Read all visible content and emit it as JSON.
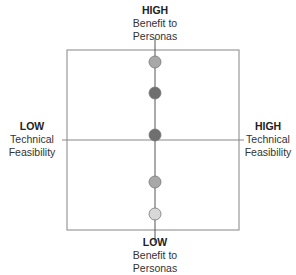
{
  "labels": {
    "top": {
      "level": "HIGH",
      "line1": "Benefit to",
      "line2": "Personas"
    },
    "bottom": {
      "level": "LOW",
      "line1": "Benefit to",
      "line2": "Personas"
    },
    "left": {
      "level": "LOW",
      "line1": "Technical",
      "line2": "Feasibility"
    },
    "right": {
      "level": "HIGH",
      "line1": "Technical",
      "line2": "Feasibility"
    }
  },
  "points": [
    {
      "cx": 155,
      "cy": 62,
      "fill": "#a8a8a8"
    },
    {
      "cx": 155,
      "cy": 93,
      "fill": "#6f6f6f"
    },
    {
      "cx": 155,
      "cy": 135,
      "fill": "#6f6f6f"
    },
    {
      "cx": 155,
      "cy": 182,
      "fill": "#a8a8a8"
    },
    {
      "cx": 155,
      "cy": 214,
      "fill": "#d8d8d8"
    }
  ]
}
